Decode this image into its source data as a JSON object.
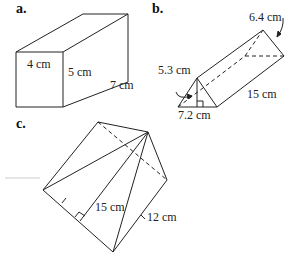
{
  "figures": {
    "a": {
      "part_label": "a.",
      "shape": "rectangular prism",
      "labels": {
        "width": "4 cm",
        "height": "5 cm",
        "length": "7 cm"
      }
    },
    "b": {
      "part_label": "b.",
      "shape": "triangular prism",
      "labels": {
        "slant_side": "6.4 cm",
        "triangle_height": "5.3 cm",
        "base": "7.2 cm",
        "length": "15 cm"
      }
    },
    "c": {
      "part_label": "c.",
      "shape": "square pyramid",
      "labels": {
        "slant_height": "15 cm",
        "base_side": "12 cm"
      }
    }
  },
  "colors": {
    "stroke": "#222222",
    "background": "#ffffff"
  }
}
